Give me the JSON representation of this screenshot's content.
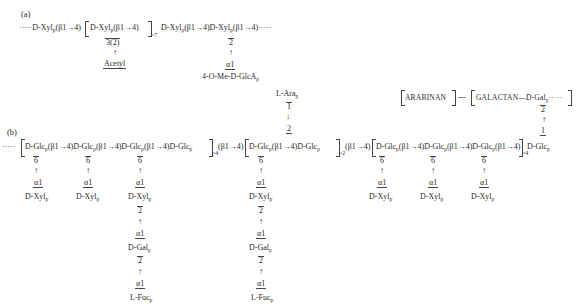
{
  "panel_a": {
    "label": "(a)",
    "chain": {
      "prefix": "·····",
      "unit1": "D-Xyl",
      "link1": "(β1→4)",
      "unit2": "D-Xyl",
      "link2": "(β1→4)",
      "repeat": "~7",
      "unit3": "D-Xyl",
      "link3": "(β1→4)",
      "unit4": "D-Xyl",
      "link4": "(β1→4)",
      "suffix": "·····",
      "sub_p": "p"
    },
    "branch_acetyl": {
      "position": "3(2)",
      "arrow": "↑",
      "group": "Acetyl"
    },
    "branch_glca": {
      "position": "2",
      "arrow": "↑",
      "anomer": "α1",
      "group": "4-O-Me-D-GlcA",
      "sub_p": "p"
    }
  },
  "panel_b": {
    "label": "(b)",
    "top_right": {
      "arabinan": "ARABINAN",
      "dash": "—",
      "galactan": "GALACTAN—D-Gal",
      "sub_p": "p",
      "suffix": "·····",
      "pos": "2",
      "arrow": "↑",
      "anomer": "1"
    },
    "backbone": {
      "prefix": "·····",
      "g1": "D-Glc",
      "l1": "(β1→4)",
      "g2": "D-Glc",
      "l2": "(β1→4)",
      "g3": "D-Glc",
      "l3": "(β1→4)",
      "g4": "D-Glc",
      "rep1": "~4",
      "l4": "(β1→4)",
      "g5": "D-Glc",
      "l5": "(β1→4)",
      "g6": "D-Glc",
      "rep2": "~2",
      "l6": "(β1→4)",
      "g7": "D-Glc",
      "l7": "(β1→4)",
      "g8": "D-Glc",
      "l8": "(β1→4)",
      "g9": "D-Glc",
      "l9": "(β1→4)",
      "rep3": "~4",
      "g10": "D-Glc",
      "sub_p": "p"
    },
    "side_chains": {
      "pos6": "6",
      "up": "↑",
      "down": "↓",
      "alpha1": "α1",
      "pos2": "2",
      "one": "1",
      "xyl": "D-Xyl",
      "gal": "D-Gal",
      "fuc": "L-Fuc",
      "ara": "L-Ara",
      "sub_p": "p"
    }
  }
}
